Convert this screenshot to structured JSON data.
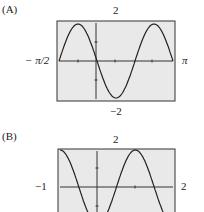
{
  "chart_data": [
    {
      "type": "line",
      "panel": "(A)",
      "xlim_labels": [
        "−π/2",
        "π"
      ],
      "ylim_labels": [
        "−2",
        "2"
      ],
      "xlim": [
        -1.5708,
        3.1416
      ],
      "ylim": [
        -2,
        2
      ],
      "function": "y = -2 sin(2x)",
      "series": [
        {
          "name": "curve",
          "x": [
            -1.5708,
            -0.7854,
            0,
            0.7854,
            1.5708,
            2.3562,
            3.1416
          ],
          "values": [
            0,
            2,
            0,
            -2,
            0,
            2,
            0
          ]
        }
      ],
      "grid": false,
      "background": "#e9e9e9"
    },
    {
      "type": "line",
      "panel": "(B)",
      "xlim_labels": [
        "−1",
        "2"
      ],
      "ylim_labels": [
        "",
        "2"
      ],
      "xlim": [
        -1,
        2
      ],
      "ylim": [
        -2,
        2
      ],
      "function": "y = -2 cos(πx)",
      "series": [
        {
          "name": "curve",
          "x": [
            -1,
            -0.5,
            0,
            0.5,
            1,
            1.5,
            2
          ],
          "values": [
            2,
            0,
            -2,
            0,
            2,
            0,
            -2
          ]
        }
      ],
      "grid": false,
      "background": "#e9e9e9"
    }
  ],
  "panels": {
    "a": {
      "label": "(A)",
      "ymax": "2",
      "ymin": "−2",
      "xmin": "− π/2",
      "xmax": "π"
    },
    "b": {
      "label": "(B)",
      "ymax": "2",
      "xmin": "−1",
      "xmax": "2"
    }
  }
}
